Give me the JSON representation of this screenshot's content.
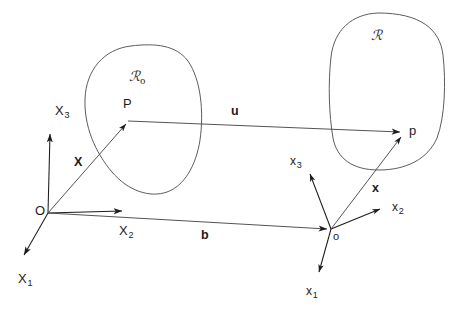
{
  "figure": {
    "kind": "continuum-mechanics-configuration-diagram",
    "background_color": "#ffffff",
    "ink_color": "#1c1c1c",
    "line_color": "#3a3a3a",
    "width": 454,
    "height": 314
  },
  "regions": {
    "reference": {
      "label": "ℛ",
      "subscript": "o",
      "name": "reference-configuration"
    },
    "current": {
      "label": "ℛ",
      "subscript": "",
      "name": "current-configuration"
    }
  },
  "points": {
    "material_point": "P",
    "spatial_point": "p",
    "origin_reference": "O",
    "origin_current": "o"
  },
  "vectors": {
    "position_reference": "X",
    "position_current": "x",
    "displacement": "u",
    "offset": "b"
  },
  "axes": {
    "reference": [
      {
        "label": "X",
        "sub": "1"
      },
      {
        "label": "X",
        "sub": "2"
      },
      {
        "label": "X",
        "sub": "3"
      }
    ],
    "current": [
      {
        "label": "x",
        "sub": "1"
      },
      {
        "label": "x",
        "sub": "2"
      },
      {
        "label": "x",
        "sub": "3"
      }
    ]
  }
}
